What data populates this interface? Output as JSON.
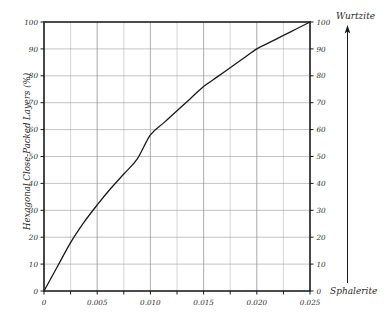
{
  "chart_data": {
    "type": "line",
    "title": "",
    "xlabel": "",
    "ylabel": "Hexagonal Close-Packed Layers (%)",
    "xlim": [
      0,
      0.025
    ],
    "ylim": [
      0,
      100
    ],
    "grid": true,
    "legend_position": "none",
    "x_ticks": [
      0,
      0.005,
      0.01,
      0.015,
      0.02,
      0.025
    ],
    "x_tick_labels": [
      "0",
      "0.005",
      "0.010",
      "0.015",
      "0.020",
      "0.025"
    ],
    "x_minor_step": 0.0025,
    "y_ticks": [
      0,
      10,
      20,
      30,
      40,
      50,
      60,
      70,
      80,
      90,
      100
    ],
    "y_tick_labels": [
      "0",
      "10",
      "20",
      "30",
      "40",
      "50",
      "60",
      "70",
      "80",
      "90",
      "100"
    ],
    "y_axis_right_label": "Hexagonal Close-Packed Layers (%)",
    "y_right_tick_labels": [
      "0",
      "10",
      "20",
      "30",
      "40",
      "50",
      "60",
      "70",
      "80",
      "90",
      "100"
    ],
    "series": [
      {
        "name": "hcp fraction",
        "x": [
          0,
          0.00125,
          0.0025,
          0.00375,
          0.005,
          0.00625,
          0.0075,
          0.00875,
          0.01,
          0.01125,
          0.0125,
          0.01375,
          0.015,
          0.01625,
          0.0175,
          0.01875,
          0.02,
          0.02125,
          0.0225,
          0.02375,
          0.025
        ],
        "values": [
          0,
          9,
          18,
          25.5,
          32,
          38,
          43.5,
          49,
          58,
          62.5,
          67,
          71.5,
          76,
          79.5,
          83,
          86.5,
          90,
          92.5,
          95,
          97.5,
          100
        ]
      }
    ],
    "annotations": {
      "top_right": "Wurtzite",
      "bottom_right": "Sphalerite",
      "arrow_direction": "up"
    }
  },
  "axes": {
    "y_title": "Hexagonal Close-Packed Layers (%)"
  },
  "labels": {
    "wurtzite": "Wurtzite",
    "sphalerite": "Sphalerite"
  },
  "x_tick_labels": [
    "0",
    "0.005",
    "0.010",
    "0.015",
    "0.020",
    "0.025"
  ],
  "y_tick_labels": [
    "0",
    "10",
    "20",
    "30",
    "40",
    "50",
    "60",
    "70",
    "80",
    "90",
    "100"
  ],
  "y_tick_labels_right": [
    "0",
    "10",
    "20",
    "30",
    "40",
    "50",
    "60",
    "70",
    "80",
    "90",
    "100"
  ],
  "colors": {
    "ink": "#1a1a1a",
    "grid": "#9a9a9a",
    "background": "#ffffff"
  }
}
